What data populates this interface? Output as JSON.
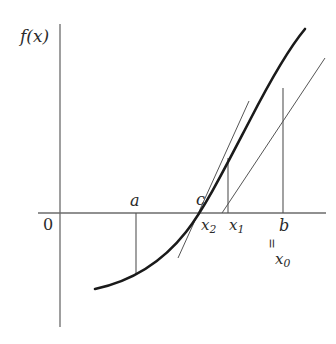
{
  "figure": {
    "axes": {
      "y_axis_label": "f(x)",
      "origin_label": "0",
      "x_axis": {
        "x_start": 38,
        "x_end": 326,
        "y": 213
      },
      "y_axis": {
        "x": 60,
        "y_start": 24,
        "y_end": 327
      }
    },
    "labels": [
      {
        "name": "y-axis-label",
        "text": "f(x)",
        "x": 20,
        "y": 28
      },
      {
        "name": "origin-label",
        "text": "0",
        "x": 43,
        "y": 217
      },
      {
        "name": "point-a-label",
        "text": "a",
        "x": 130,
        "y": 193
      },
      {
        "name": "point-c-label",
        "text": "c",
        "x": 196,
        "y": 192
      },
      {
        "name": "point-x2-label",
        "text": "x2",
        "base": "x",
        "subscript": "2",
        "x": 201,
        "y": 218
      },
      {
        "name": "point-x1-label",
        "text": "x1",
        "base": "x",
        "subscript": "1",
        "x": 229,
        "y": 218
      },
      {
        "name": "point-b-label",
        "text": "b",
        "x": 279,
        "y": 218
      },
      {
        "name": "equals-label",
        "text": "=",
        "x": 279,
        "y": 238
      },
      {
        "name": "point-x0-label",
        "text": "x0",
        "base": "x",
        "subscript": "0",
        "x": 275,
        "y": 252
      }
    ],
    "curve": {
      "name": "function-curve",
      "description": "Convex increasing curve f(x) crossing the x-axis at c",
      "stroke": "#1a1a1a",
      "stroke_width": 2.6,
      "path": "M 95,289 C 128,282 160,265 186,232 C 205,208 226,166 250,120 C 268,85 290,47 305,29"
    },
    "secant_line": {
      "name": "secant-line-b",
      "description": "Secant/tangent line at b = x0 meeting the axis near x1",
      "stroke": "#555555",
      "stroke_width": 1.0,
      "x1": 325,
      "y1": 58,
      "x2": 222,
      "y2": 213
    },
    "tangent_line": {
      "name": "tangent-line-x1",
      "description": "Tangent line at x1 meeting the axis near x2",
      "stroke": "#555555",
      "stroke_width": 1.0,
      "x1": 248,
      "y1": 103,
      "x2": 178,
      "y2": 258
    },
    "drop_lines": [
      {
        "name": "drop-line-a",
        "x": 136,
        "y_top": 213,
        "y_bottom": 274,
        "stroke": "#555555"
      },
      {
        "name": "drop-line-x1",
        "x": 228,
        "y_top": 158,
        "y_bottom": 213,
        "stroke": "#555555"
      },
      {
        "name": "drop-line-b",
        "x": 283,
        "y_top": 88,
        "y_bottom": 213,
        "stroke": "#555555"
      }
    ],
    "colors": {
      "background": "#ffffff",
      "axis": "#6b6b6b",
      "curve": "#1a1a1a",
      "thin_line": "#555555",
      "text": "#2b2b2b"
    }
  }
}
